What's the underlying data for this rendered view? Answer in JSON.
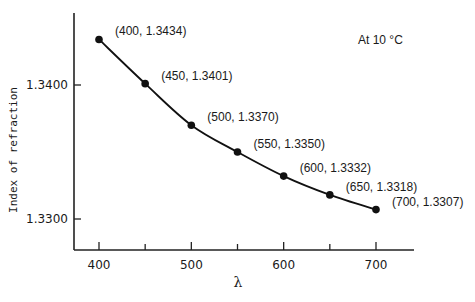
{
  "chart_data": {
    "type": "line",
    "title": "",
    "xlabel": "λ",
    "ylabel": "Index of refraction",
    "annotation": "At 10 °C",
    "x": [
      400,
      450,
      500,
      550,
      600,
      650,
      700
    ],
    "y": [
      1.3434,
      1.3401,
      1.337,
      1.335,
      1.3332,
      1.3318,
      1.3307
    ],
    "point_labels": [
      "(400, 1.3434)",
      "(450, 1.3401)",
      "(500, 1.3370)",
      "(550, 1.3350)",
      "(600, 1.3332)",
      "(650, 1.3318)",
      "(700, 1.3307)"
    ],
    "x_ticks": [
      400,
      450,
      500,
      550,
      600,
      650,
      700
    ],
    "x_tick_labels": [
      "400",
      "",
      "500",
      "",
      "600",
      "",
      "700"
    ],
    "y_ticks": [
      1.34,
      1.33
    ],
    "y_tick_labels": [
      "1.3400",
      "1.3300"
    ],
    "xlim": [
      373,
      772
    ],
    "ylim": [
      1.3277,
      1.3451
    ],
    "grid": false,
    "legend": "none",
    "series": [
      {
        "name": "Index of refraction",
        "values": [
          1.3434,
          1.3401,
          1.337,
          1.335,
          1.3332,
          1.3318,
          1.3307
        ]
      }
    ]
  }
}
